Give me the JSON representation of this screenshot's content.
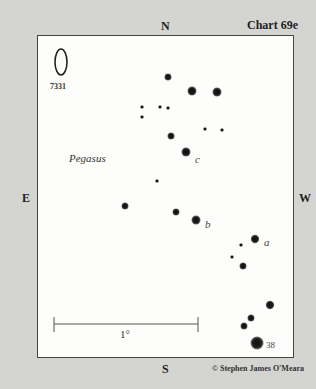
{
  "header": {
    "chart_title": "Chart 69e",
    "directions": {
      "north": "N",
      "south": "S",
      "east": "E",
      "west": "W"
    }
  },
  "map": {
    "constellation": "Pegasus",
    "galaxy": {
      "id": "7331",
      "cx": 61,
      "cy": 62,
      "rx": 6,
      "ry": 13
    },
    "scale_bar": {
      "label": "1°",
      "x1": 54,
      "x2": 198,
      "y": 324
    },
    "star_labels": [
      {
        "text": "c",
        "x": 195,
        "y": 153
      },
      {
        "text": "b",
        "x": 205,
        "y": 218
      },
      {
        "text": "a",
        "x": 264,
        "y": 236
      },
      {
        "text": "38",
        "x": 266,
        "y": 340
      }
    ],
    "stars": [
      {
        "x": 168,
        "y": 77,
        "r": 3.5
      },
      {
        "x": 192,
        "y": 91,
        "r": 4.5
      },
      {
        "x": 217,
        "y": 92,
        "r": 4.5
      },
      {
        "x": 142,
        "y": 107,
        "r": 1.8
      },
      {
        "x": 160,
        "y": 107,
        "r": 1.8
      },
      {
        "x": 168,
        "y": 108,
        "r": 1.8
      },
      {
        "x": 142,
        "y": 117,
        "r": 1.8
      },
      {
        "x": 205,
        "y": 129,
        "r": 1.8
      },
      {
        "x": 222,
        "y": 130,
        "r": 1.8
      },
      {
        "x": 171,
        "y": 136,
        "r": 3.5
      },
      {
        "x": 186,
        "y": 152,
        "r": 4.5
      },
      {
        "x": 157,
        "y": 181,
        "r": 1.8
      },
      {
        "x": 125,
        "y": 206,
        "r": 3.5
      },
      {
        "x": 176,
        "y": 212,
        "r": 3.5
      },
      {
        "x": 196,
        "y": 220,
        "r": 4.5
      },
      {
        "x": 255,
        "y": 239,
        "r": 4.2
      },
      {
        "x": 241,
        "y": 245,
        "r": 1.8
      },
      {
        "x": 232,
        "y": 257,
        "r": 1.8
      },
      {
        "x": 243,
        "y": 266,
        "r": 3.5
      },
      {
        "x": 270,
        "y": 305,
        "r": 4.2
      },
      {
        "x": 251,
        "y": 318,
        "r": 3.5
      },
      {
        "x": 244,
        "y": 326,
        "r": 3.5
      },
      {
        "x": 257,
        "y": 343,
        "r": 6.5
      }
    ]
  },
  "footer": {
    "copyright": "© Stephen James O'Meara"
  }
}
